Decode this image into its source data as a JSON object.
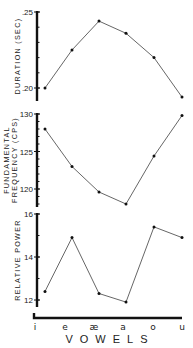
{
  "chart_data": {
    "type": "line",
    "layout": "three vertically stacked panels sharing x axis",
    "categories": [
      "i",
      "e",
      "æ",
      "a",
      "o",
      "u"
    ],
    "xlabel": "VOWELS",
    "grid": false,
    "legend": null,
    "panels": [
      {
        "name": "duration",
        "ylabel": "DURATION (SEC)",
        "ylabel_lines": [
          "DURATION (SEC)"
        ],
        "yticks": [
          0.2,
          0.25
        ],
        "ytick_labels": [
          ".20",
          ".25"
        ],
        "minor_tick_step": 0.01,
        "ylim": [
          0.192,
          0.25
        ],
        "values": [
          0.2,
          0.225,
          0.244,
          0.236,
          0.22,
          0.194
        ]
      },
      {
        "name": "fundamental-frequency",
        "ylabel": "FUNDAMENTAL FREQUENCY (CPS)",
        "ylabel_lines": [
          "FUNDAMENTAL",
          "FREQUENCY (CPS)"
        ],
        "yticks": [
          120,
          125,
          130
        ],
        "ytick_labels": [
          "120",
          "125",
          "130"
        ],
        "minor_tick_step": 1,
        "ylim": [
          117.5,
          130
        ],
        "values": [
          128,
          123,
          119.6,
          118,
          124.4,
          129.8
        ]
      },
      {
        "name": "relative-power",
        "ylabel": "RELATIVE POWER",
        "ylabel_lines": [
          "RELATIVE POWER"
        ],
        "yticks": [
          12,
          14,
          16
        ],
        "ytick_labels": [
          "12",
          "14",
          "16"
        ],
        "minor_tick_step": 1,
        "ylim": [
          11.7,
          16
        ],
        "values": [
          12.4,
          14.9,
          12.3,
          11.9,
          15.4,
          14.9
        ]
      }
    ]
  }
}
